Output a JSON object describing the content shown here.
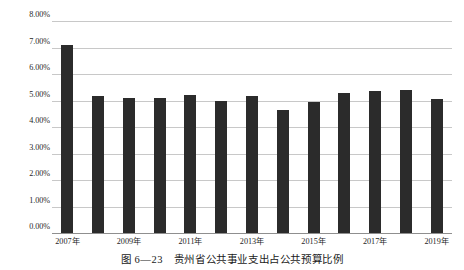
{
  "figure": {
    "caption": "图 6—23　贵州省公共事业支出占公共预算比例",
    "bar_color": "#2b2b2b",
    "gridline_color": "#c8c8c8",
    "axis_color": "#8f8f8f"
  },
  "chart_data": {
    "type": "bar",
    "title": "",
    "xlabel": "",
    "ylabel": "",
    "ylim": [
      0,
      8
    ],
    "grid": true,
    "legend": "none",
    "y_tick_labels": [
      "0.00%",
      "1.00%",
      "2.00%",
      "3.00%",
      "4.00%",
      "5.00%",
      "6.00%",
      "7.00%",
      "8.00%"
    ],
    "y_tick_values": [
      0,
      1,
      2,
      3,
      4,
      5,
      6,
      7,
      8
    ],
    "x_tick_labels": [
      "2007年",
      "2009年",
      "2011年",
      "2013年",
      "2015年",
      "2017年",
      "2019年"
    ],
    "x_tick_indices": [
      0,
      2,
      4,
      6,
      8,
      10,
      12
    ],
    "categories": [
      "2007年",
      "2008年",
      "2009年",
      "2010年",
      "2011年",
      "2012年",
      "2013年",
      "2014年",
      "2015年",
      "2016年",
      "2017年",
      "2018年",
      "2019年"
    ],
    "values": [
      7.1,
      5.18,
      5.08,
      5.1,
      5.22,
      4.98,
      5.18,
      4.65,
      4.93,
      5.28,
      5.35,
      5.38,
      5.05
    ],
    "value_unit": "%"
  }
}
